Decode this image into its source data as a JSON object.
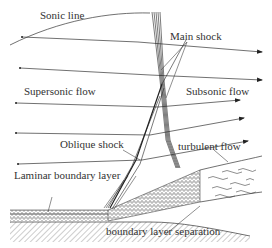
{
  "diagram": {
    "type": "shock-wave boundary-layer interaction schematic",
    "labels": {
      "sonic_line": "Sonic line",
      "main_shock": "Main shock",
      "supersonic_flow": "Supersonic flow",
      "subsonic_flow": "Subsonic flow",
      "oblique_shock": "Oblique shock",
      "turbulent_flow": "turbulent flow",
      "laminar_boundary_layer": "Laminar boundary layer",
      "boundary_layer_separation": "boundary layer separation"
    },
    "colors": {
      "background": "#ffffff",
      "ink": "#333333"
    }
  }
}
